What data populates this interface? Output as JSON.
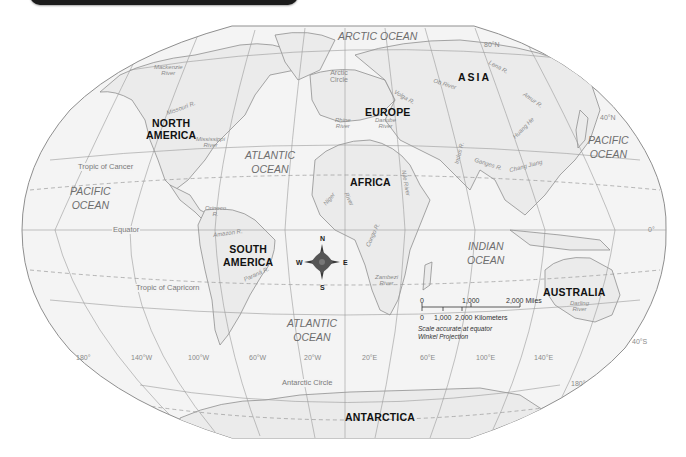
{
  "title_bar": {
    "color": "#1c1c1c"
  },
  "map": {
    "projection": "Winkel Projection",
    "colors": {
      "ocean": "#f4f4f4",
      "land": "#ebebeb",
      "outline": "#8f8f8f",
      "grid": "#9a9a9a",
      "border_bg": "#ffffff"
    },
    "continents": [
      {
        "id": "north-america",
        "label_line1": "NORTH",
        "label_line2": "AMERICA"
      },
      {
        "id": "south-america",
        "label_line1": "SOUTH",
        "label_line2": "AMERICA"
      },
      {
        "id": "europe",
        "label": "EUROPE"
      },
      {
        "id": "asia",
        "label": "ASIA"
      },
      {
        "id": "africa",
        "label": "AFRICA"
      },
      {
        "id": "australia",
        "label": "AUSTRALIA"
      },
      {
        "id": "antarctica",
        "label": "ANTARCTICA"
      }
    ],
    "oceans": {
      "arctic": "ARCTIC  OCEAN",
      "atlantic_north": {
        "l1": "ATLANTIC",
        "l2": "OCEAN"
      },
      "atlantic_south": {
        "l1": "ATLANTIC",
        "l2": "OCEAN"
      },
      "pacific_west": {
        "l1": "PACIFIC",
        "l2": "OCEAN"
      },
      "pacific_east": {
        "l1": "PACIFIC",
        "l2": "OCEAN"
      },
      "indian": {
        "l1": "INDIAN",
        "l2": "OCEAN"
      }
    },
    "rivers": {
      "mackenzie": {
        "l1": "Mackenzie",
        "l2": "River"
      },
      "missouri": "Missouri R.",
      "mississippi": {
        "l1": "Mississippi",
        "l2": "River"
      },
      "orinoco": {
        "l1": "Orinoco",
        "l2": "R."
      },
      "amazon": "Amazon R.",
      "parana": "Paraná R.",
      "rhine": {
        "l1": "Rhine",
        "l2": "River"
      },
      "danube": {
        "l1": "Danube",
        "l2": "River"
      },
      "volga": "Volga R.",
      "ob": "Ob River",
      "lena": "Lena R.",
      "amur": "Amur R.",
      "huang_he": "Huang He",
      "indus": "Indus R.",
      "ganges": "Ganges R.",
      "chang_jiang": "Chang Jiang",
      "nile": {
        "l1": "Nile",
        "l2": "River"
      },
      "niger": {
        "l1": "Niger",
        "l2": "River"
      },
      "congo": "Congo R.",
      "zambezi": {
        "l1": "Zambezi",
        "l2": "River"
      },
      "darling": {
        "l1": "Darling",
        "l2": "River"
      }
    },
    "lines": {
      "arctic_circle": {
        "l1": "Arctic",
        "l2": "Circle"
      },
      "tropic_cancer": "Tropic of Cancer",
      "equator": "Equator",
      "tropic_capricorn": "Tropic of Capricorn",
      "antarctic_circle": "Antarctic Circle"
    },
    "latitudes": {
      "n80": "80°N",
      "n40": "40°N",
      "zero": "0°",
      "s40": "40°S"
    },
    "longitudes": [
      "180°",
      "140°W",
      "100°W",
      "60°W",
      "20°W",
      "20°E",
      "60°E",
      "100°E",
      "140°E",
      "180°"
    ],
    "compass": {
      "n": "N",
      "s": "S",
      "e": "E",
      "w": "W",
      "color": "#3a3a3a"
    },
    "scale": {
      "miles": [
        "0",
        "1,000",
        "2,000 Miles"
      ],
      "km": [
        "0",
        "1,000",
        "2,000 Kilometers"
      ],
      "note1": "Scale accurate at equator",
      "note2": "Winkel Projection"
    }
  }
}
